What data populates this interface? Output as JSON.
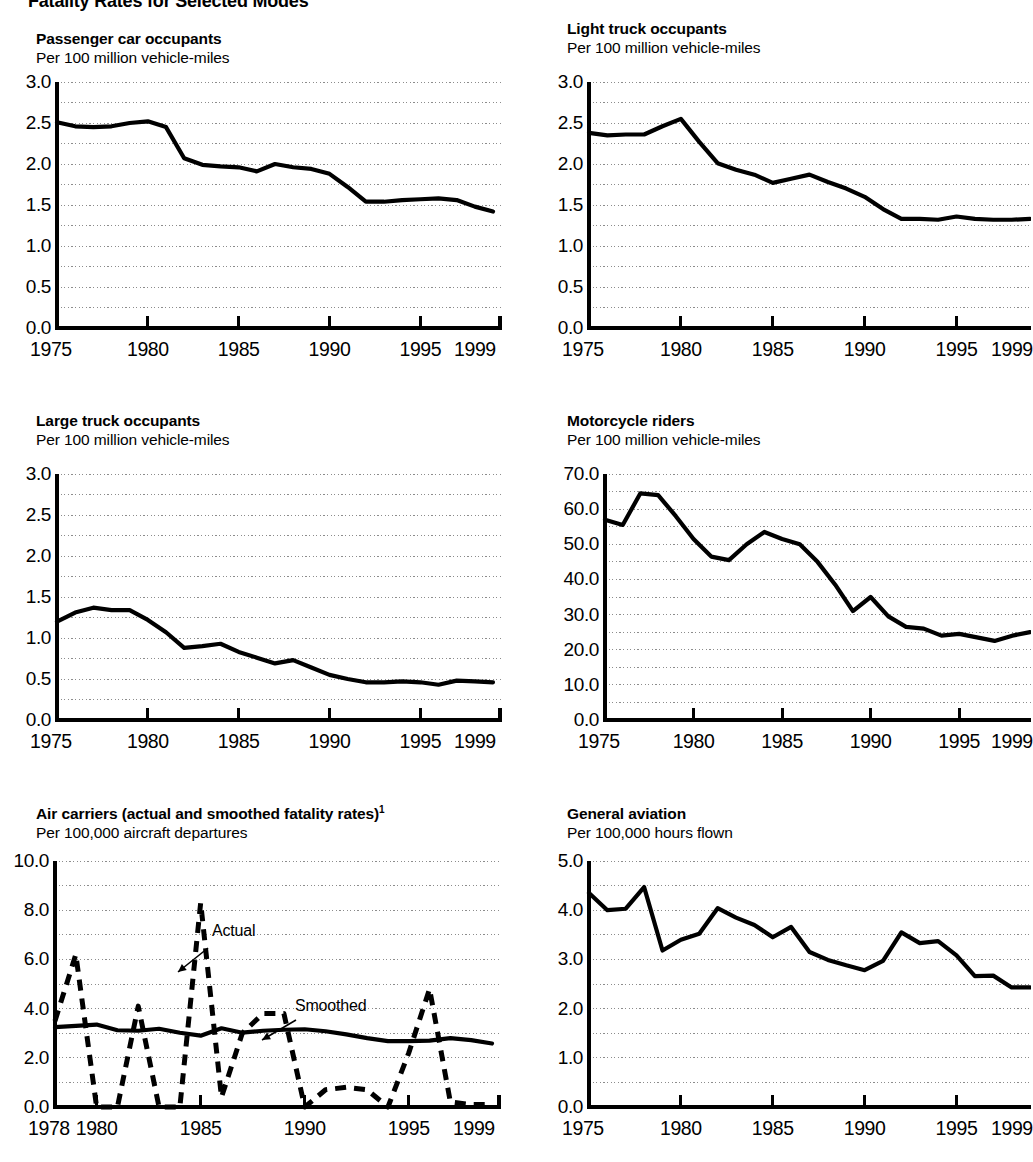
{
  "figure": {
    "title": "Fatality Rates for Selected Modes"
  },
  "panels": [
    {
      "id": "passenger-car-occupants",
      "title": "Passenger car occupants",
      "subtitle": "Per 100 million vehicle-miles",
      "yticks": [
        "0.0",
        "0.5",
        "1.0",
        "1.5",
        "2.0",
        "2.5",
        "3.0"
      ],
      "xticks": [
        "1975",
        "1980",
        "1985",
        "1990",
        "1995",
        "1999"
      ]
    },
    {
      "id": "light-truck-occupants",
      "title": "Light truck occupants",
      "subtitle": "Per 100 million vehicle-miles",
      "yticks": [
        "0.0",
        "0.5",
        "1.0",
        "1.5",
        "2.0",
        "2.5",
        "3.0"
      ],
      "xticks": [
        "1975",
        "1980",
        "1985",
        "1990",
        "1995",
        "1999"
      ]
    },
    {
      "id": "large-truck-occupants",
      "title": "Large truck occupants",
      "subtitle": "Per 100 million vehicle-miles",
      "yticks": [
        "0.0",
        "0.5",
        "1.0",
        "1.5",
        "2.0",
        "2.5",
        "3.0"
      ],
      "xticks": [
        "1975",
        "1980",
        "1985",
        "1990",
        "1995",
        "1999"
      ]
    },
    {
      "id": "motorcycle-riders",
      "title": "Motorcycle riders",
      "subtitle": "Per 100 million vehicle-miles",
      "yticks": [
        "0.0",
        "10.0",
        "20.0",
        "30.0",
        "40.0",
        "50.0",
        "60.0",
        "70.0"
      ],
      "xticks": [
        "1975",
        "1980",
        "1985",
        "1990",
        "1995",
        "1999"
      ]
    },
    {
      "id": "air-carriers",
      "title": "Air carriers (actual and smoothed fatality rates)",
      "title_superscript": "1",
      "subtitle": "Per 100,000 aircraft departures",
      "yticks": [
        "0.0",
        "2.0",
        "4.0",
        "6.0",
        "8.0",
        "10.0"
      ],
      "xticks": [
        "1978",
        "1980",
        "1985",
        "1990",
        "1995",
        "1999"
      ],
      "annotations": [
        {
          "label": "Actual"
        },
        {
          "label": "Smoothed"
        }
      ]
    },
    {
      "id": "general-aviation",
      "title": "General aviation",
      "subtitle": "Per 100,000 hours flown",
      "yticks": [
        "0.0",
        "1.0",
        "2.0",
        "3.0",
        "4.0",
        "5.0"
      ],
      "xticks": [
        "1975",
        "1980",
        "1985",
        "1990",
        "1995",
        "1999"
      ]
    }
  ],
  "chart_data": [
    {
      "type": "line",
      "title": "Passenger car occupants",
      "ylabel": "Per 100 million vehicle-miles",
      "xlabel": "",
      "xlim": [
        1975,
        1999
      ],
      "ylim": [
        0.0,
        3.0
      ],
      "grid": true,
      "x": [
        1975,
        1976,
        1977,
        1978,
        1979,
        1980,
        1981,
        1982,
        1983,
        1984,
        1985,
        1986,
        1987,
        1988,
        1989,
        1990,
        1991,
        1992,
        1993,
        1994,
        1995,
        1996,
        1997,
        1998,
        1999
      ],
      "values": [
        2.51,
        2.46,
        2.45,
        2.46,
        2.5,
        2.52,
        2.45,
        2.07,
        1.99,
        1.97,
        1.96,
        1.91,
        2.0,
        1.96,
        1.94,
        1.88,
        1.72,
        1.54,
        1.54,
        1.56,
        1.57,
        1.58,
        1.56,
        1.48,
        1.42
      ]
    },
    {
      "type": "line",
      "title": "Light truck occupants",
      "ylabel": "Per 100 million vehicle-miles",
      "xlabel": "",
      "xlim": [
        1975,
        1999
      ],
      "ylim": [
        0.0,
        3.0
      ],
      "grid": true,
      "x": [
        1975,
        1976,
        1977,
        1978,
        1979,
        1980,
        1981,
        1982,
        1983,
        1984,
        1985,
        1986,
        1987,
        1988,
        1989,
        1990,
        1991,
        1992,
        1993,
        1994,
        1995,
        1996,
        1997,
        1998,
        1999
      ],
      "values": [
        2.38,
        2.35,
        2.36,
        2.36,
        2.46,
        2.55,
        2.27,
        2.01,
        1.93,
        1.87,
        1.77,
        1.82,
        1.87,
        1.78,
        1.7,
        1.6,
        1.45,
        1.33,
        1.33,
        1.32,
        1.36,
        1.33,
        1.32,
        1.32,
        1.33
      ]
    },
    {
      "type": "line",
      "title": "Large truck occupants",
      "ylabel": "Per 100 million vehicle-miles",
      "xlabel": "",
      "xlim": [
        1975,
        1999
      ],
      "ylim": [
        0.0,
        3.0
      ],
      "grid": true,
      "x": [
        1975,
        1976,
        1977,
        1978,
        1979,
        1980,
        1981,
        1982,
        1983,
        1984,
        1985,
        1986,
        1987,
        1988,
        1989,
        1990,
        1991,
        1992,
        1993,
        1994,
        1995,
        1996,
        1997,
        1998,
        1999
      ],
      "values": [
        1.2,
        1.31,
        1.37,
        1.34,
        1.34,
        1.22,
        1.07,
        0.88,
        0.9,
        0.93,
        0.83,
        0.76,
        0.69,
        0.73,
        0.64,
        0.55,
        0.5,
        0.46,
        0.46,
        0.47,
        0.46,
        0.43,
        0.48,
        0.47,
        0.46
      ]
    },
    {
      "type": "line",
      "title": "Motorcycle riders",
      "ylabel": "Per 100 million vehicle-miles",
      "xlabel": "",
      "xlim": [
        1975,
        1999
      ],
      "ylim": [
        0.0,
        70.0
      ],
      "grid": true,
      "x": [
        1975,
        1976,
        1977,
        1978,
        1979,
        1980,
        1981,
        1982,
        1983,
        1984,
        1985,
        1986,
        1987,
        1988,
        1989,
        1990,
        1991,
        1992,
        1993,
        1994,
        1995,
        1996,
        1997,
        1998,
        1999
      ],
      "values": [
        57.0,
        55.5,
        64.5,
        64.0,
        58.0,
        51.5,
        46.5,
        45.5,
        50.0,
        53.5,
        51.5,
        50.0,
        45.0,
        38.5,
        31.0,
        35.0,
        29.5,
        26.5,
        26.0,
        24.0,
        24.5,
        23.5,
        22.5,
        24.0,
        25.0
      ]
    },
    {
      "type": "line",
      "title": "Air carriers (actual and smoothed fatality rates)",
      "ylabel": "Per 100,000 aircraft departures",
      "xlabel": "",
      "xlim": [
        1978,
        1999
      ],
      "ylim": [
        0.0,
        10.0
      ],
      "grid": true,
      "x": [
        1978,
        1979,
        1980,
        1981,
        1982,
        1983,
        1984,
        1985,
        1986,
        1987,
        1988,
        1989,
        1990,
        1991,
        1992,
        1993,
        1994,
        1995,
        1996,
        1997,
        1998,
        1999
      ],
      "series": [
        {
          "name": "Actual",
          "style": "dashed",
          "values": [
            3.5,
            6.2,
            0.0,
            0.0,
            4.1,
            0.0,
            0.0,
            8.3,
            0.4,
            3.0,
            3.8,
            3.8,
            0.0,
            0.7,
            0.8,
            0.7,
            0.0,
            2.2,
            4.8,
            0.2,
            0.1,
            0.1
          ]
        },
        {
          "name": "Smoothed",
          "style": "solid",
          "values": [
            3.25,
            3.3,
            3.35,
            3.12,
            3.1,
            3.18,
            3.02,
            2.9,
            3.2,
            3.02,
            3.1,
            3.14,
            3.16,
            3.08,
            2.95,
            2.8,
            2.68,
            2.68,
            2.7,
            2.8,
            2.72,
            2.58
          ]
        }
      ]
    },
    {
      "type": "line",
      "title": "General aviation",
      "ylabel": "Per 100,000 hours flown",
      "xlabel": "",
      "xlim": [
        1975,
        1999
      ],
      "ylim": [
        0.0,
        5.0
      ],
      "grid": true,
      "x": [
        1975,
        1976,
        1977,
        1978,
        1979,
        1980,
        1981,
        1982,
        1983,
        1984,
        1985,
        1986,
        1987,
        1988,
        1989,
        1990,
        1991,
        1992,
        1993,
        1994,
        1995,
        1996,
        1997,
        1998,
        1999
      ],
      "values": [
        4.35,
        4.0,
        4.03,
        4.47,
        3.18,
        3.4,
        3.52,
        4.04,
        3.85,
        3.7,
        3.45,
        3.66,
        3.15,
        2.99,
        2.88,
        2.78,
        2.97,
        3.55,
        3.33,
        3.37,
        3.08,
        2.66,
        2.67,
        2.43,
        2.43
      ]
    }
  ]
}
